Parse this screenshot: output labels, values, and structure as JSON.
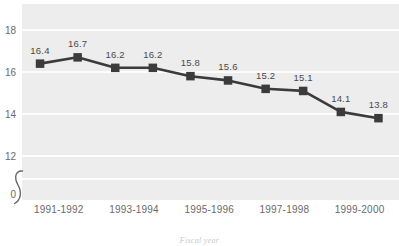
{
  "chart_data": {
    "type": "line",
    "title": "",
    "subtitle": "",
    "xlabel": "Fiscal year",
    "ylabel": "",
    "categories": [
      "1991-1992",
      "1992-1993",
      "1993-1994",
      "1994-1995",
      "1995-1996",
      "1996-1997",
      "1997-1998",
      "1998-1999",
      "1999-2000",
      "2000-2001"
    ],
    "values": [
      16.4,
      16.7,
      16.2,
      16.2,
      15.8,
      15.6,
      15.2,
      15.1,
      14.1,
      13.8
    ],
    "point_labels": [
      "16.4",
      "16.7",
      "16.2",
      "16.2",
      "15.8",
      "15.6",
      "15.2",
      "15.1",
      "14.1",
      "13.8"
    ],
    "series": [
      {
        "name": "",
        "values": [
          16.4,
          16.7,
          16.2,
          16.2,
          15.8,
          15.6,
          15.2,
          15.1,
          14.1,
          13.8
        ]
      }
    ],
    "x_tick_labels": [
      "1991-1992",
      "1993-1994",
      "1995-1996",
      "1997-1998",
      "1999-2000"
    ],
    "y_tick_labels": [
      "18",
      "16",
      "14",
      "12",
      "0"
    ],
    "y_tick_values": [
      18,
      16,
      14,
      12,
      0
    ],
    "ylim": [
      11.2,
      18.9
    ],
    "axis_break": true,
    "axis_break_symbol": "squiggle",
    "grid": true,
    "grid_color": "#fdfdfd",
    "legend": "none",
    "plot_background": "#ededed",
    "page_background": "#ffffff",
    "series_color": "#3b3b3b",
    "marker_shape": "square",
    "label_color": "#4a4a4a",
    "tick_color": "#6a6a6a"
  }
}
